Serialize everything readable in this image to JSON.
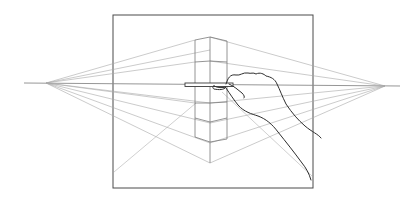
{
  "illustration": {
    "title": "Two-point perspective drawing with hand holding pencil",
    "colors": {
      "background": "#ffffff",
      "frame": "#4a4a4a",
      "construction": "#9a9a9a",
      "cube": "#7a7a7a",
      "hand": "#2e2e2e"
    },
    "horizon": {
      "y": 83,
      "x_start": 24,
      "x_end": 400
    },
    "vanishing_points": {
      "left": {
        "x": 46,
        "y": 83
      },
      "right": {
        "x": 385,
        "y": 86
      }
    },
    "frame": {
      "x": 113,
      "y": 15,
      "width": 200,
      "height": 173
    },
    "cube": {
      "front_edge_x": 210,
      "left_edge_x": 195,
      "right_edge_x": 227,
      "top_y": 37,
      "bottom_y": 163
    },
    "icons": {
      "hand": "hand-with-pencil-icon"
    }
  }
}
